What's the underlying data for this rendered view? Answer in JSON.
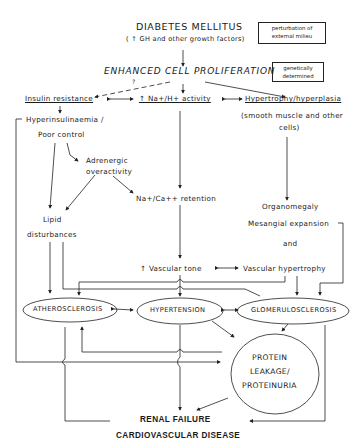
{
  "diagram": {
    "title": "DIABETES MELLITUS",
    "subtitle": "( ↑ GH and other growth factors)",
    "legend": {
      "external": "perturbation of external milieu",
      "genetic": "genetically determined"
    },
    "central": "ENHANCED CELL PROLIFERATION",
    "question_mark": "?",
    "nodes": {
      "insulin_resistance": "Insulin resistance",
      "na_h_activity": "↑ Na+/H+ activity",
      "hypertrophy": "Hypertrophy/hyperplasia",
      "hypertrophy_note": "(smooth muscle and other",
      "hypertrophy_note2": "cells)",
      "hyperinsulinaemia": "Hyperinsulinaemia /",
      "poor_control": "Poor control",
      "adrenergic": "Adrenergic",
      "adrenergic2": "overactivity",
      "na_ca_retention": "Na+/Ca++ retention",
      "lipid": "Lipid",
      "lipid2": "disturbances",
      "organomegaly": "Organomegaly",
      "mesangial": "Mesangial expansion",
      "and": "and",
      "vascular_tone": "↑ Vascular tone",
      "vascular_hypertrophy": "Vascular hypertrophy",
      "atherosclerosis": "ATHEROSCLEROSIS",
      "hypertension": "HYPERTENSION",
      "glomerulosclerosis": "GLOMERULOSCLEROSIS",
      "protein1": "PROTEIN",
      "protein2": "LEAKAGE/",
      "protein3": "PROTEINURIA"
    },
    "outcomes": {
      "renal": "RENAL FAILURE",
      "cardio": "CARDIOVASCULAR DISEASE"
    }
  }
}
